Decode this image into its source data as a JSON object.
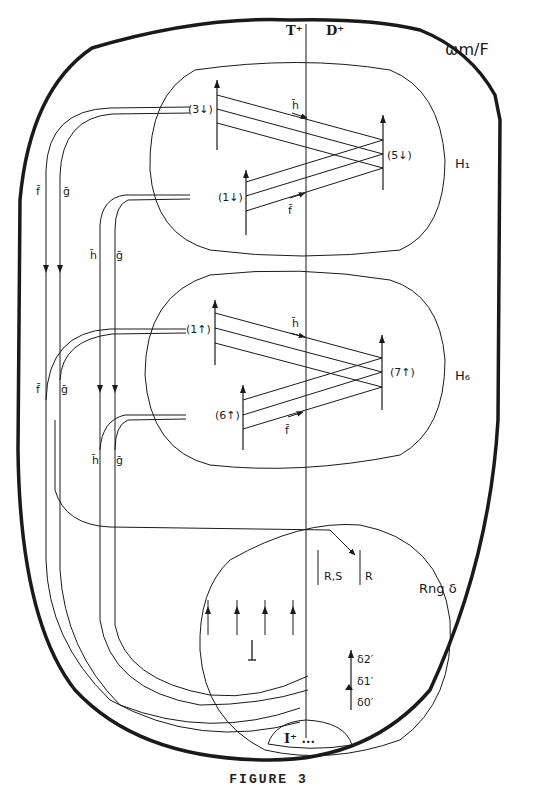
{
  "figure": {
    "caption": "FIGURE 3",
    "title": "ωm/F",
    "colors": {
      "ink": "#1a1a1a",
      "background": "#ffffff"
    }
  },
  "columns": {
    "left_header": "T⁺",
    "right_header": "D⁺"
  },
  "regions": [
    {
      "id": "H1",
      "label": "H₁"
    },
    {
      "id": "H6",
      "label": "H₆"
    },
    {
      "id": "rng",
      "label": "Rng δ"
    },
    {
      "id": "iplus",
      "label": "I⁺ ..."
    }
  ],
  "nodes": {
    "h1": {
      "top_left": "(3↓)",
      "bottom_left": "(1↓)",
      "right": "(5↓)"
    },
    "h6": {
      "top_left": "(1↑)",
      "bottom_left": "(6↑)",
      "right": "(7↑)"
    },
    "rng": {
      "left_box": "R,S",
      "right_box": "R",
      "d2": "δ2′",
      "d1": "δ1′",
      "d0": "δ0′"
    }
  },
  "maps": {
    "h_bar": "h̄",
    "f_bar": "f̄",
    "g_bar": "ḡ"
  },
  "side_labels": {
    "upper_f": "f̄",
    "upper_g": "ḡ",
    "upper_h": "h̄",
    "upper_g2": "ḡ",
    "lower_f": "f̄",
    "lower_g": "ḡ",
    "lower_h": "h̄",
    "lower_g2": "ḡ"
  }
}
